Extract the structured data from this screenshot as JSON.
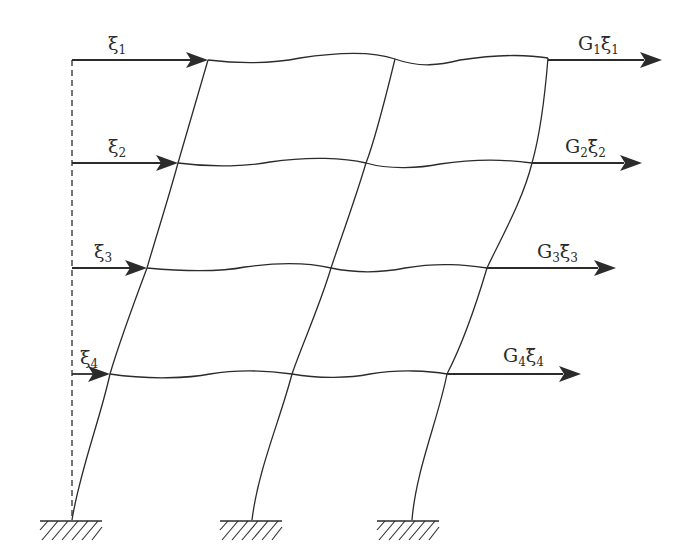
{
  "figure": {
    "stroke_color": "#2b2b2b",
    "background": "#ffffff"
  },
  "left_labels": [
    {
      "symbol": "ξ",
      "subscript": "1"
    },
    {
      "symbol": "ξ",
      "subscript": "2"
    },
    {
      "symbol": "ξ",
      "subscript": "3"
    },
    {
      "symbol": "ξ",
      "subscript": "4"
    }
  ],
  "right_labels": [
    {
      "mass": "G",
      "mass_subscript": "1",
      "symbol": "ξ̈",
      "subscript": "1"
    },
    {
      "mass": "G",
      "mass_subscript": "2",
      "symbol": "ξ̈",
      "subscript": "2"
    },
    {
      "mass": "G",
      "mass_subscript": "3",
      "symbol": "ξ̈",
      "subscript": "3"
    },
    {
      "mass": "G",
      "mass_subscript": "4",
      "symbol": "ξ̈",
      "subscript": "4"
    }
  ],
  "supports": [
    {
      "name": "left",
      "type": "fixed"
    },
    {
      "name": "middle",
      "type": "fixed"
    },
    {
      "name": "right",
      "type": "fixed"
    }
  ],
  "storeys": 4,
  "bays": 2
}
